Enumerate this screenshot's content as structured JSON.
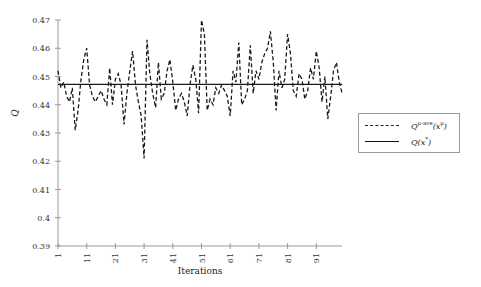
{
  "chart_data": {
    "type": "line",
    "title": "",
    "xlabel": "Iterations",
    "ylabel": "Q",
    "ylim": [
      0.39,
      0.47
    ],
    "xlim": [
      1,
      100
    ],
    "yticks": [
      "0.39",
      "0.4",
      "0.41",
      "0.42",
      "0.43",
      "0.44",
      "0.45",
      "0.46",
      "0.47"
    ],
    "xticks": [
      "1",
      "11",
      "21",
      "31",
      "41",
      "51",
      "61",
      "71",
      "81",
      "91"
    ],
    "grid": false,
    "legend_position": "right-outside",
    "series": [
      {
        "name": "Q^{μ-ave}(x^μ)",
        "style": "dashed",
        "x": [
          1,
          2,
          3,
          4,
          5,
          6,
          7,
          8,
          9,
          10,
          11,
          12,
          13,
          14,
          15,
          16,
          17,
          18,
          19,
          20,
          21,
          22,
          23,
          24,
          25,
          26,
          27,
          28,
          29,
          30,
          31,
          32,
          33,
          34,
          35,
          36,
          37,
          38,
          39,
          40,
          41,
          42,
          43,
          44,
          45,
          46,
          47,
          48,
          49,
          50,
          51,
          52,
          53,
          54,
          55,
          56,
          57,
          58,
          59,
          60,
          61,
          62,
          63,
          64,
          65,
          66,
          67,
          68,
          69,
          70,
          71,
          72,
          73,
          74,
          75,
          76,
          77,
          78,
          79,
          80,
          81,
          82,
          83,
          84,
          85,
          86,
          87,
          88,
          89,
          90,
          91,
          92,
          93,
          94,
          95,
          96,
          97,
          98,
          99,
          100
        ],
        "values": [
          0.452,
          0.446,
          0.448,
          0.443,
          0.441,
          0.446,
          0.431,
          0.438,
          0.449,
          0.456,
          0.46,
          0.447,
          0.443,
          0.441,
          0.443,
          0.445,
          0.442,
          0.44,
          0.453,
          0.44,
          0.449,
          0.451,
          0.447,
          0.433,
          0.444,
          0.452,
          0.459,
          0.447,
          0.441,
          0.436,
          0.421,
          0.463,
          0.451,
          0.444,
          0.439,
          0.455,
          0.442,
          0.444,
          0.452,
          0.456,
          0.448,
          0.438,
          0.442,
          0.444,
          0.441,
          0.436,
          0.447,
          0.454,
          0.449,
          0.437,
          0.47,
          0.465,
          0.438,
          0.442,
          0.44,
          0.446,
          0.444,
          0.447,
          0.445,
          0.443,
          0.436,
          0.452,
          0.448,
          0.462,
          0.44,
          0.442,
          0.445,
          0.461,
          0.444,
          0.452,
          0.449,
          0.455,
          0.458,
          0.46,
          0.466,
          0.455,
          0.438,
          0.452,
          0.446,
          0.449,
          0.465,
          0.458,
          0.445,
          0.443,
          0.451,
          0.449,
          0.442,
          0.445,
          0.453,
          0.449,
          0.459,
          0.453,
          0.441,
          0.45,
          0.435,
          0.443,
          0.452,
          0.455,
          0.448,
          0.444
        ]
      },
      {
        "name": "Q(x*)",
        "style": "solid",
        "x": [
          1,
          100
        ],
        "values": [
          0.4472,
          0.4472
        ]
      }
    ]
  },
  "legend": {
    "items": [
      {
        "base": "Q",
        "sup": "μ-ave",
        "arg": "(x",
        "argsup": "μ",
        "close": ")"
      },
      {
        "base": "Q",
        "sup": "",
        "arg": "(x",
        "argsup": "*",
        "close": ")"
      }
    ]
  }
}
